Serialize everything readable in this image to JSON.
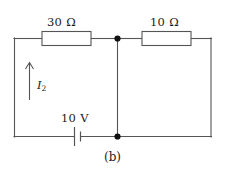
{
  "figure": {
    "caption": "(b)",
    "colors": {
      "background": "#ffffff",
      "wire": "#555555",
      "node": "#111111",
      "text": "#1a1a1a"
    }
  },
  "circuit": {
    "components": [
      {
        "id": "resistor-left",
        "type": "resistor",
        "label": "30 Ω",
        "value": 30,
        "unit": "Ω",
        "branch": "top-left"
      },
      {
        "id": "resistor-right",
        "type": "resistor",
        "label": "10 Ω",
        "value": 10,
        "unit": "Ω",
        "branch": "top-right"
      },
      {
        "id": "voltage-source",
        "type": "battery",
        "label": "10 V",
        "value": 10,
        "unit": "V",
        "branch": "bottom-left"
      }
    ],
    "current": {
      "id": "current-i2",
      "symbol": "I",
      "subscript": "2",
      "direction": "up",
      "branch": "left-vertical"
    },
    "nodes": [
      {
        "id": "node-top-center",
        "label": ""
      },
      {
        "id": "node-bottom-center",
        "label": ""
      }
    ]
  }
}
